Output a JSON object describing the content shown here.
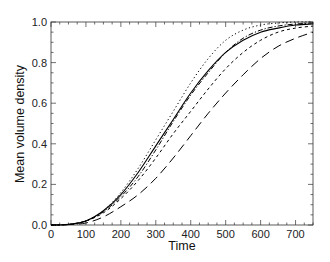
{
  "chart_data": {
    "type": "line",
    "title": "",
    "xlabel": "Time",
    "ylabel": "Mean volume density",
    "xlim": [
      0,
      750
    ],
    "ylim": [
      0.0,
      1.0
    ],
    "xticks": [
      0,
      100,
      200,
      300,
      400,
      500,
      600,
      700
    ],
    "yticks": [
      0.0,
      0.2,
      0.4,
      0.6,
      0.8,
      1.0
    ],
    "xtick_labels": [
      "0",
      "100",
      "200",
      "300",
      "400",
      "500",
      "600",
      "700"
    ],
    "ytick_labels": [
      "0.0",
      "0.2",
      "0.4",
      "0.6",
      "0.8",
      "1.0"
    ],
    "grid": false,
    "legend": null,
    "x": [
      0,
      50,
      100,
      150,
      200,
      250,
      300,
      350,
      400,
      450,
      500,
      550,
      600,
      650,
      700,
      750
    ],
    "series": [
      {
        "name": "dotted",
        "style": "dotted",
        "values": [
          0.0,
          0.003,
          0.02,
          0.07,
          0.16,
          0.28,
          0.42,
          0.56,
          0.7,
          0.82,
          0.91,
          0.96,
          0.985,
          0.995,
          1.0,
          1.0
        ]
      },
      {
        "name": "solid",
        "style": "solid",
        "values": [
          0.0,
          0.003,
          0.02,
          0.07,
          0.15,
          0.26,
          0.39,
          0.52,
          0.65,
          0.76,
          0.85,
          0.91,
          0.95,
          0.97,
          0.985,
          0.99
        ]
      },
      {
        "name": "dash-dot",
        "style": "dashdot",
        "values": [
          0.0,
          0.003,
          0.02,
          0.065,
          0.14,
          0.24,
          0.37,
          0.51,
          0.64,
          0.75,
          0.85,
          0.92,
          0.96,
          0.98,
          0.99,
          0.995
        ]
      },
      {
        "name": "short-dash",
        "style": "dashed",
        "values": [
          0.0,
          0.003,
          0.02,
          0.06,
          0.13,
          0.22,
          0.33,
          0.45,
          0.56,
          0.67,
          0.77,
          0.85,
          0.91,
          0.95,
          0.97,
          0.98
        ]
      },
      {
        "name": "long-dash",
        "style": "longdash",
        "values": [
          0.0,
          0.002,
          0.01,
          0.04,
          0.09,
          0.15,
          0.23,
          0.33,
          0.44,
          0.55,
          0.65,
          0.74,
          0.82,
          0.88,
          0.92,
          0.95
        ]
      }
    ]
  }
}
